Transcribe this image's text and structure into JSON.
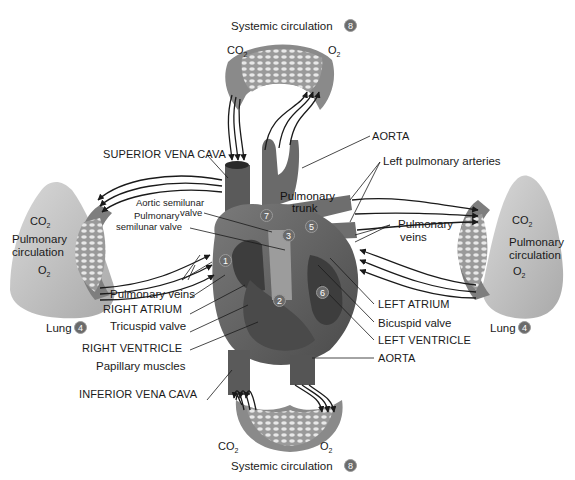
{
  "figure": {
    "colors": {
      "background": "#ffffff",
      "tissue_dark": "#555555",
      "tissue_mid": "#8a8a8a",
      "tissue_light": "#bdbdbd",
      "lung": "#c8c8c8",
      "badge": "#6b6b6b",
      "arrow": "#1a1a1a"
    }
  },
  "systemic_top": {
    "title": "Systemic circulation",
    "badge": "8",
    "co2": "CO",
    "co2_sub": "2",
    "o2": "O",
    "o2_sub": "2"
  },
  "systemic_bottom": {
    "title": "Systemic circulation",
    "badge": "8",
    "co2": "CO",
    "co2_sub": "2",
    "o2": "O",
    "o2_sub": "2"
  },
  "lung_left": {
    "co2": "CO",
    "co2_sub": "2",
    "title_line1": "Pulmonary",
    "title_line2": "circulation",
    "o2": "O",
    "o2_sub": "2",
    "lung_label": "Lung",
    "badge": "4"
  },
  "lung_right": {
    "co2": "CO",
    "co2_sub": "2",
    "title_line1": "Pulmonary",
    "title_line2": "circulation",
    "o2": "O",
    "o2_sub": "2",
    "lung_label": "Lung",
    "badge": "4"
  },
  "labels_left": {
    "superior_vena_cava": "SUPERIOR VENA CAVA",
    "aortic_valve_line1": "Aortic semilunar",
    "aortic_valve_line2": "valve",
    "pulm_valve_line1": "Pulmonary",
    "pulm_valve_line2": "semilunar valve",
    "pulmonary_veins": "Pulmonary veins",
    "right_atrium": "RIGHT ATRIUM",
    "tricuspid": "Tricuspid valve",
    "right_ventricle": "RIGHT VENTRICLE",
    "papillary": "Papillary muscles",
    "inferior_vena_cava": "INFERIOR VENA CAVA"
  },
  "labels_right": {
    "aorta_top": "AORTA",
    "left_pulm_arteries": "Left pulmonary arteries",
    "pulm_trunk_line1": "Pulmonary",
    "pulm_trunk_line2": "trunk",
    "pulm_veins_line1": "Pulmonary",
    "pulm_veins_line2": "veins",
    "left_atrium": "LEFT ATRIUM",
    "bicuspid": "Bicuspid valve",
    "left_ventricle": "LEFT VENTRICLE",
    "aorta_bottom": "AORTA"
  },
  "heart_steps": [
    "1",
    "2",
    "3",
    "5",
    "6",
    "7"
  ]
}
